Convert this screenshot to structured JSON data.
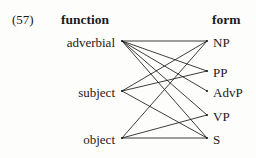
{
  "example": {
    "number": "(57)"
  },
  "columns": {
    "left_heading": "function",
    "right_heading": "form"
  },
  "diagram": {
    "type": "bipartite-mapping",
    "left_nodes": [
      {
        "id": "adverbial",
        "label": "adverbial",
        "x": 122,
        "y": 41
      },
      {
        "id": "subject",
        "label": "subject",
        "x": 122,
        "y": 91
      },
      {
        "id": "object",
        "label": "object",
        "x": 122,
        "y": 138
      }
    ],
    "right_nodes": [
      {
        "id": "NP",
        "label": "NP",
        "x": 207,
        "y": 41
      },
      {
        "id": "PP",
        "label": "PP",
        "x": 207,
        "y": 71
      },
      {
        "id": "AdvP",
        "label": "AdvP",
        "x": 207,
        "y": 91
      },
      {
        "id": "VP",
        "label": "VP",
        "x": 207,
        "y": 115
      },
      {
        "id": "S",
        "label": "S",
        "x": 207,
        "y": 138
      }
    ],
    "edges": [
      {
        "from": "adverbial",
        "to": "NP"
      },
      {
        "from": "adverbial",
        "to": "PP"
      },
      {
        "from": "adverbial",
        "to": "AdvP"
      },
      {
        "from": "adverbial",
        "to": "VP"
      },
      {
        "from": "adverbial",
        "to": "S"
      },
      {
        "from": "subject",
        "to": "NP"
      },
      {
        "from": "subject",
        "to": "PP"
      },
      {
        "from": "subject",
        "to": "S"
      },
      {
        "from": "object",
        "to": "NP"
      },
      {
        "from": "object",
        "to": "VP"
      },
      {
        "from": "object",
        "to": "S"
      }
    ],
    "stroke_color": "#1b1b1b"
  }
}
